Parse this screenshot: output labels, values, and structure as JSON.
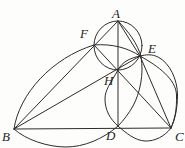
{
  "figure": {
    "stroke_color": "#2e2c2a",
    "background_color": "#fdfdfc",
    "points": {
      "A": {
        "x": 118,
        "y": 21
      },
      "B": {
        "x": 14,
        "y": 129
      },
      "C": {
        "x": 171,
        "y": 128
      },
      "D": {
        "x": 118,
        "y": 126
      },
      "E": {
        "x": 140,
        "y": 56
      },
      "F": {
        "x": 94,
        "y": 45
      },
      "H": {
        "x": 118,
        "y": 70
      }
    },
    "segments": [
      "B-C",
      "A-B",
      "A-E",
      "E-C",
      "A-D",
      "B-E",
      "C-F"
    ],
    "circles": [
      "circle through A, F, H, E (diameter AH)",
      "arc through B, F, E, C (diameter BC)",
      "arc through A, E, D, B (diameter AB)",
      "arc through E, H, D, C (diameter CH)"
    ],
    "labels": [
      {
        "id": "A",
        "text": "A",
        "x": 112,
        "y": 7
      },
      {
        "id": "B",
        "text": "B",
        "x": 2,
        "y": 130
      },
      {
        "id": "C",
        "text": "C",
        "x": 175,
        "y": 130
      },
      {
        "id": "D",
        "text": "D",
        "x": 106,
        "y": 129
      },
      {
        "id": "E",
        "text": "E",
        "x": 148,
        "y": 42
      },
      {
        "id": "F",
        "text": "F",
        "x": 80,
        "y": 27
      },
      {
        "id": "H",
        "text": "H",
        "x": 104,
        "y": 74
      }
    ]
  }
}
